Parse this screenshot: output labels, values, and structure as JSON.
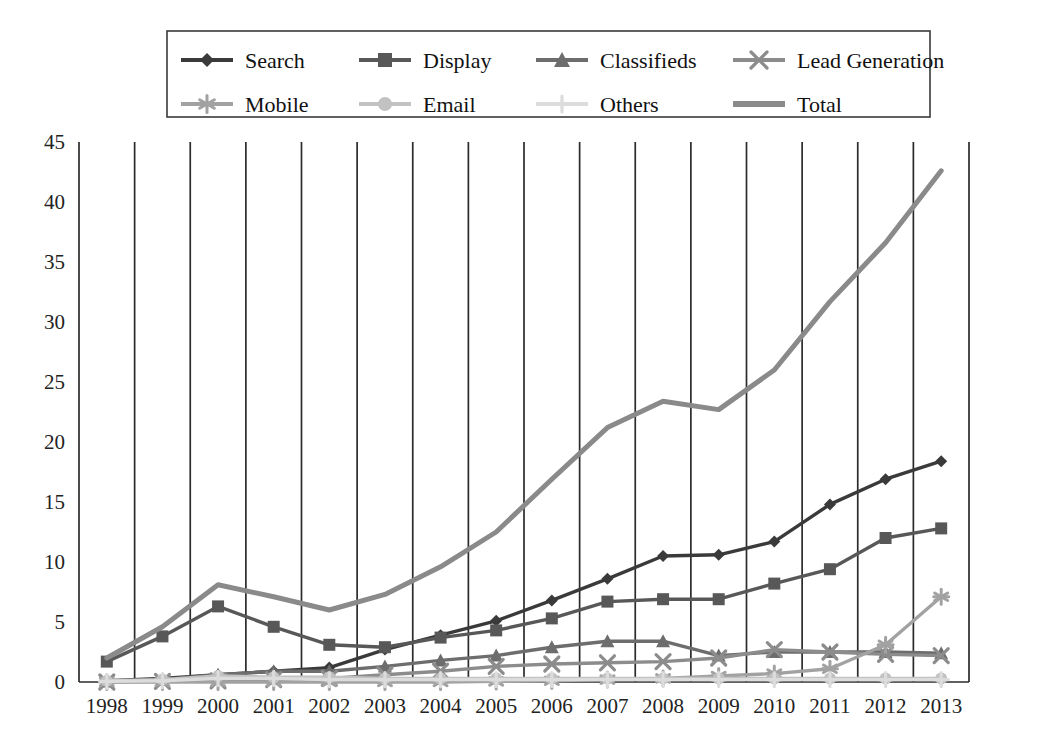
{
  "chart_data": {
    "type": "line",
    "title": "",
    "subtitle": "",
    "xlabel": "",
    "ylabel": "",
    "categories": [
      "1998",
      "1999",
      "2000",
      "2001",
      "2002",
      "2003",
      "2004",
      "2005",
      "2006",
      "2007",
      "2008",
      "2009",
      "2010",
      "2011",
      "2012",
      "2013"
    ],
    "x": [
      1998,
      1999,
      2000,
      2001,
      2002,
      2003,
      2004,
      2005,
      2006,
      2007,
      2008,
      2009,
      2010,
      2011,
      2012,
      2013
    ],
    "ylim": [
      0,
      45
    ],
    "yticks": [
      0,
      5,
      10,
      15,
      20,
      25,
      30,
      35,
      40,
      45
    ],
    "grid": "vertical",
    "legend_position": "top",
    "legend_columns": 4,
    "series": [
      {
        "name": "Search",
        "marker": "diamond",
        "color": "#3a3a3a",
        "values": [
          0.1,
          0.3,
          0.6,
          0.9,
          1.2,
          2.7,
          3.9,
          5.1,
          6.8,
          8.6,
          10.5,
          10.6,
          11.7,
          14.8,
          16.9,
          18.4
        ]
      },
      {
        "name": "Display",
        "marker": "square",
        "color": "#585858",
        "values": [
          1.7,
          3.8,
          6.3,
          4.6,
          3.1,
          2.9,
          3.7,
          4.3,
          5.3,
          6.7,
          6.9,
          6.9,
          8.2,
          9.4,
          12.0,
          12.8
        ]
      },
      {
        "name": "Classifieds",
        "marker": "triangle",
        "color": "#6d6d6d",
        "values": [
          0.05,
          0.2,
          0.6,
          0.9,
          0.9,
          1.3,
          1.8,
          2.2,
          2.9,
          3.4,
          3.4,
          2.2,
          2.5,
          2.5,
          2.5,
          2.4
        ]
      },
      {
        "name": "Lead Generation",
        "marker": "cross",
        "color": "#8c8c8c",
        "values": [
          0.0,
          0.05,
          0.1,
          0.2,
          0.3,
          0.6,
          0.9,
          1.3,
          1.5,
          1.6,
          1.7,
          2.0,
          2.7,
          2.5,
          2.3,
          2.2
        ]
      },
      {
        "name": "Mobile",
        "marker": "asterisk",
        "color": "#a2a2a2",
        "values": [
          0.0,
          0.0,
          0.0,
          0.0,
          0.0,
          0.0,
          0.0,
          0.05,
          0.1,
          0.2,
          0.3,
          0.5,
          0.7,
          1.1,
          3.1,
          7.1
        ]
      },
      {
        "name": "Email",
        "marker": "circle",
        "color": "#c2c2c2",
        "values": [
          0.1,
          0.2,
          0.5,
          0.4,
          0.4,
          0.3,
          0.3,
          0.3,
          0.3,
          0.3,
          0.3,
          0.3,
          0.3,
          0.3,
          0.3,
          0.3
        ]
      },
      {
        "name": "Others",
        "marker": "plus",
        "color": "#dcdcdc",
        "values": [
          0.05,
          0.1,
          0.3,
          0.3,
          0.2,
          0.2,
          0.2,
          0.2,
          0.2,
          0.2,
          0.2,
          0.2,
          0.2,
          0.2,
          0.2,
          0.2
        ]
      },
      {
        "name": "Total",
        "marker": "none",
        "color": "#8a8a8a",
        "values": [
          2.0,
          4.6,
          8.1,
          7.1,
          6.0,
          7.3,
          9.6,
          12.5,
          16.9,
          21.2,
          23.4,
          22.7,
          26.0,
          31.7,
          36.6,
          42.6
        ]
      }
    ]
  },
  "axes": {
    "y_tick_labels": [
      "45",
      "40",
      "35",
      "30",
      "25",
      "20",
      "15",
      "10",
      "5",
      "0"
    ],
    "x_tick_labels": [
      "1998",
      "1999",
      "2000",
      "2001",
      "2002",
      "2003",
      "2004",
      "2005",
      "2006",
      "2007",
      "2008",
      "2009",
      "2010",
      "2011",
      "2012",
      "2013"
    ]
  },
  "legend": {
    "entries": [
      {
        "label": "Search",
        "marker": "diamond",
        "color": "#3a3a3a"
      },
      {
        "label": "Display",
        "marker": "square",
        "color": "#585858"
      },
      {
        "label": "Classifieds",
        "marker": "triangle",
        "color": "#6d6d6d"
      },
      {
        "label": "Lead Generation",
        "marker": "cross",
        "color": "#8c8c8c"
      },
      {
        "label": "Mobile",
        "marker": "asterisk",
        "color": "#a2a2a2"
      },
      {
        "label": "Email",
        "marker": "circle",
        "color": "#c2c2c2"
      },
      {
        "label": "Others",
        "marker": "plus",
        "color": "#dcdcdc"
      },
      {
        "label": "Total",
        "marker": "none",
        "color": "#8a8a8a"
      }
    ]
  },
  "colors": {
    "background": "#ffffff",
    "axis": "#2b2b2b",
    "grid": "#2b2b2b",
    "text": "#1a1a1a"
  }
}
